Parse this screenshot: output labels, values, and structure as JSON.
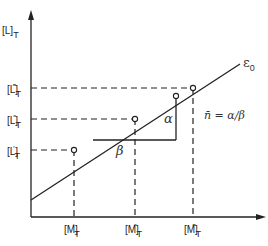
{
  "diagram": {
    "y_axis": {
      "label": "[L]",
      "sub": "T"
    },
    "x_axis": {
      "label": "",
      "sub": ""
    },
    "line_label": "ε",
    "line_label_sub": "0",
    "y_ticks": [
      {
        "label": "[L]",
        "sup": "‴",
        "sub": "T"
      },
      {
        "label": "[L]",
        "sup": "″",
        "sub": "T"
      },
      {
        "label": "[L]",
        "sup": "′",
        "sub": "T"
      }
    ],
    "x_ticks": [
      {
        "label": "[M]",
        "sup": "′",
        "sub": "T"
      },
      {
        "label": "[M]",
        "sup": "″",
        "sub": "T"
      },
      {
        "label": "[M]",
        "sup": "‴",
        "sub": "T"
      }
    ],
    "alpha": "α",
    "beta": "β",
    "formula": "n̄ = α/β",
    "colors": {
      "ink": "#222222",
      "background": "#ffffff"
    }
  }
}
